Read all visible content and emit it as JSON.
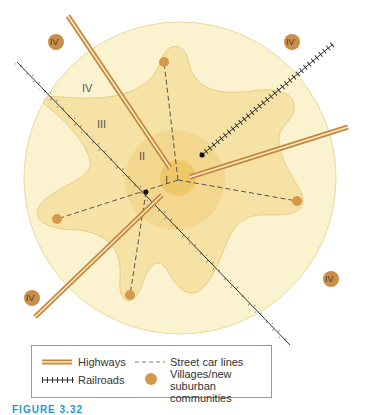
{
  "diagram": {
    "zones": [
      {
        "id": "I",
        "label": "I",
        "description": "Central core"
      },
      {
        "id": "II",
        "label": "II",
        "description": "Inner zone"
      },
      {
        "id": "III",
        "label": "III",
        "description": "Star-shaped streetcar suburbs"
      },
      {
        "id": "IV",
        "label": "IV",
        "description": "Outer zone"
      }
    ],
    "outer_badges": [
      "IV",
      "IV",
      "IV",
      "IV"
    ],
    "colors": {
      "zone_IV": "#fbf2cf",
      "zone_III": "#f7e2a6",
      "zone_II": "#f3d58a",
      "zone_I": "#eec868",
      "highway": "#c8873a",
      "railroad": "#333333",
      "village": "#d49a4c",
      "badge": "#c98f4a"
    }
  },
  "legend": {
    "highways": "Highways",
    "street_car_lines": "Street car lines",
    "railroads": "Railroads",
    "villages_line1": "Villages/new",
    "villages_line2": "suburban communities"
  },
  "caption": "FIGURE 3.32"
}
